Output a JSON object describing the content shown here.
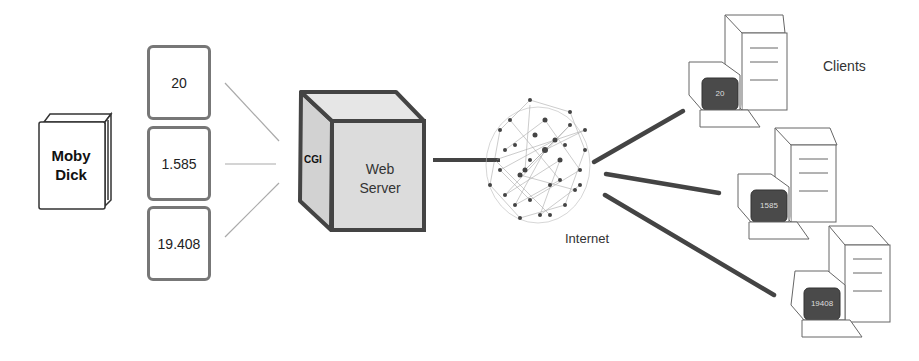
{
  "diagram": {
    "book": {
      "title_line1": "Moby",
      "title_line2": "Dick"
    },
    "counters": [
      {
        "value": "20"
      },
      {
        "value": "1.585"
      },
      {
        "value": "19.408"
      }
    ],
    "server": {
      "side_label": "CGI",
      "front_line1": "Web",
      "front_line2": "Server"
    },
    "network": {
      "label": "Internet"
    },
    "clients": {
      "label": "Clients",
      "items": [
        {
          "screen": "20"
        },
        {
          "screen": "1585"
        },
        {
          "screen": "19408"
        }
      ]
    },
    "colors": {
      "box_border": "#777777",
      "server_fill": "#d9d9d9",
      "server_border": "#444444",
      "link_line": "#444444",
      "screen_fill": "#4a4a4a"
    }
  }
}
